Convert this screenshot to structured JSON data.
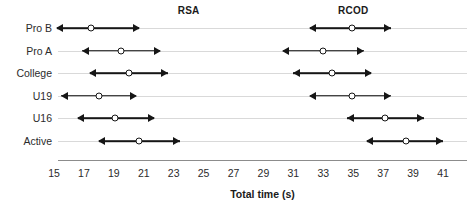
{
  "chart_data": {
    "type": "scatter",
    "title": "",
    "xlabel": "Total time (s)",
    "ylabel": "",
    "xlim": [
      15,
      41
    ],
    "ylim": [
      0,
      7
    ],
    "grid": true,
    "legend_position": "top-inline",
    "xticks": [
      15,
      17,
      19,
      21,
      23,
      25,
      27,
      29,
      31,
      33,
      35,
      37,
      39,
      41
    ],
    "xtick_labels": [
      "15",
      "17",
      "19",
      "21",
      "23",
      "25",
      "27",
      "29",
      "31",
      "33",
      "35",
      "37",
      "39",
      "41"
    ],
    "categories": [
      "Pro B",
      "Pro A",
      "College",
      "U19",
      "U16",
      "Active"
    ],
    "series": [
      {
        "name": "RSA",
        "label_x": 24.0,
        "mean": [
          17.5,
          19.5,
          20.0,
          18.0,
          19.1,
          20.7
        ],
        "low": [
          15.2,
          16.9,
          17.4,
          15.5,
          16.6,
          18.0
        ],
        "high": [
          20.7,
          22.1,
          22.6,
          20.5,
          21.7,
          23.4
        ]
      },
      {
        "name": "RCOD",
        "label_x": 35.0,
        "mean": [
          34.9,
          33.0,
          33.6,
          34.9,
          37.1,
          38.5
        ],
        "low": [
          32.1,
          30.3,
          31.0,
          32.1,
          34.6,
          35.9
        ],
        "high": [
          37.5,
          35.7,
          36.2,
          37.5,
          39.7,
          41.0
        ]
      }
    ],
    "colors": {
      "marker_stroke": "#161616",
      "marker_fill": "#ffffff",
      "interval_line": "#161616",
      "gridline": "#d9d9d9",
      "axis": "#8c8c8c",
      "text": "#2b2b2b"
    }
  }
}
